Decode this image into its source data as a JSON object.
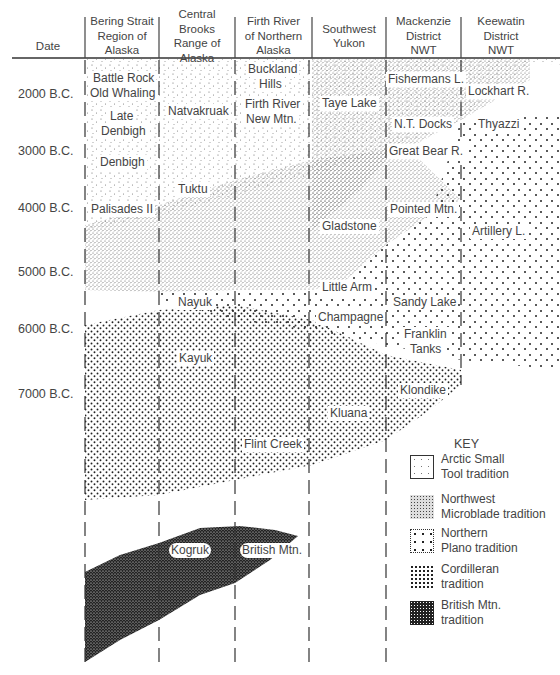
{
  "header": {
    "date_label": "Date",
    "columns": [
      {
        "id": "bering",
        "label_lines": [
          "Bering Strait",
          "Region of",
          "Alaska"
        ]
      },
      {
        "id": "brooks",
        "label_lines": [
          "Central Brooks",
          "Range of",
          "Alaska"
        ]
      },
      {
        "id": "firth",
        "label_lines": [
          "Firth River",
          "of Northern",
          "Alaska"
        ]
      },
      {
        "id": "yukon",
        "label_lines": [
          "Southwest",
          "Yukon"
        ]
      },
      {
        "id": "mackenzie",
        "label_lines": [
          "Mackenzie",
          "District",
          "NWT"
        ]
      },
      {
        "id": "keewatin",
        "label_lines": [
          "Keewatin",
          "District",
          "NWT"
        ]
      }
    ]
  },
  "dates": [
    "2000 B.C.",
    "3000 B.C.",
    "4000 B.C.",
    "5000 B.C.",
    "6000 B.C.",
    "7000 B.C."
  ],
  "sites": {
    "bering": [
      "Battle Rock",
      "Old Whaling",
      "Late",
      "Denbigh",
      "Denbigh",
      "Palisades II"
    ],
    "brooks": [
      "Natvakruak",
      "Tuktu",
      "Nayuk",
      "Kayuk",
      "Kogruk"
    ],
    "firth": [
      "Buckland",
      "Hills",
      "Firth River",
      "New Mtn.",
      "Flint Creek",
      "British Mtn."
    ],
    "yukon": [
      "Taye Lake",
      "Gladstone",
      "Little Arm",
      "Champagne",
      "Kluana"
    ],
    "mackenzie": [
      "Fishermans L.",
      "N.T. Docks",
      "Great Bear R.",
      "Pointed Mtn.",
      "Sandy Lake",
      "Franklin",
      "Tanks",
      "Klondike"
    ],
    "keewatin": [
      "Lockhart R.",
      "Thyazzi",
      "Artillery L."
    ]
  },
  "key": {
    "title": "KEY",
    "items": [
      {
        "id": "arctic-small-tool",
        "lines": [
          "Arctic Small",
          "Tool tradition"
        ]
      },
      {
        "id": "northwest-microblade",
        "lines": [
          "Northwest",
          "Microblade tradition"
        ]
      },
      {
        "id": "northern-plano",
        "lines": [
          "Northern",
          "Plano tradition"
        ]
      },
      {
        "id": "cordilleran",
        "lines": [
          "Cordilleran",
          "tradition"
        ]
      },
      {
        "id": "british-mtn",
        "lines": [
          "British Mtn.",
          "tradition"
        ]
      }
    ]
  }
}
